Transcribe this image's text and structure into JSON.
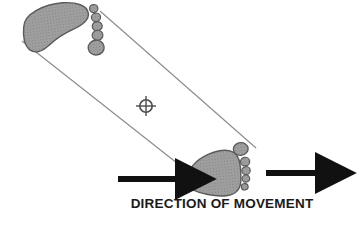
{
  "figure": {
    "caption": "DIRECTION OF MOVEMENT",
    "colors": {
      "footprint_fill": "#9c9c9c",
      "footprint_stroke": "#5a5a5a",
      "guide_line": "#8a8a8a",
      "arrow": "#111111",
      "crosshair": "#4d4d4d",
      "background": "#ffffff",
      "caption_text": "#1a1a1a"
    }
  },
  "chart_data": {
    "type": "diagram",
    "title": "DIRECTION OF MOVEMENT",
    "footprints": [
      {
        "name": "upper-left-footprint",
        "position": "upper-left",
        "sole_center_x": 63,
        "sole_center_y": 27,
        "rotation_deg": -8,
        "toe_side": "right",
        "big_toe": "bottom",
        "toes": [
          {
            "index": 1,
            "label": "little-toe",
            "cx": 96,
            "cy": 13,
            "rx": 4.2,
            "ry": 4.0
          },
          {
            "index": 2,
            "label": "fourth-toe",
            "cx": 97,
            "cy": 22,
            "rx": 4.6,
            "ry": 4.3
          },
          {
            "index": 3,
            "label": "third-toe",
            "cx": 97,
            "cy": 31,
            "rx": 5.0,
            "ry": 4.6
          },
          {
            "index": 4,
            "label": "second-toe",
            "cx": 96,
            "cy": 40,
            "rx": 5.4,
            "ry": 5.0
          },
          {
            "index": 5,
            "label": "big-toe",
            "cx": 94,
            "cy": 52,
            "rx": 8.0,
            "ry": 7.4
          }
        ]
      },
      {
        "name": "lower-right-footprint",
        "position": "lower-right",
        "sole_center_x": 213,
        "sole_center_y": 172,
        "rotation_deg": -6,
        "toe_side": "right",
        "big_toe": "top",
        "toes": [
          {
            "index": 1,
            "label": "big-toe",
            "cx": 243,
            "cy": 152,
            "rx": 7.4,
            "ry": 6.4
          },
          {
            "index": 2,
            "label": "second-toe",
            "cx": 245,
            "cy": 165,
            "rx": 4.6,
            "ry": 4.3
          },
          {
            "index": 3,
            "label": "third-toe",
            "cx": 245,
            "cy": 174,
            "rx": 4.2,
            "ry": 4.0
          },
          {
            "index": 4,
            "label": "fourth-toe",
            "cx": 244,
            "cy": 182,
            "rx": 3.8,
            "ry": 3.6
          },
          {
            "index": 5,
            "label": "little-toe",
            "cx": 242,
            "cy": 190,
            "rx": 3.4,
            "ry": 3.2
          }
        ]
      }
    ],
    "guide_lines": [
      {
        "name": "upper-line-of-direction",
        "x1": 100,
        "y1": 11,
        "x2": 256,
        "y2": 148
      },
      {
        "name": "lower-line-of-direction",
        "x1": 22,
        "y1": 41,
        "x2": 196,
        "y2": 178
      }
    ],
    "crosshair": {
      "name": "centre-of-gravity-marker",
      "cx": 146,
      "cy": 106,
      "radius": 6.2,
      "arm_length": 10
    },
    "arrows": [
      {
        "name": "left-direction-arrow",
        "x1": 118,
        "y1": 179,
        "x2": 191,
        "y2": 179,
        "thickness": 6
      },
      {
        "name": "right-direction-arrow",
        "x1": 266,
        "y1": 173,
        "x2": 331,
        "y2": 173,
        "thickness": 6
      }
    ]
  }
}
